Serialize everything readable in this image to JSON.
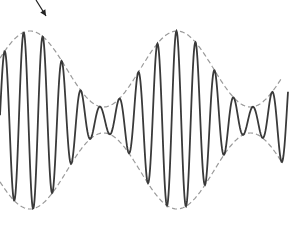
{
  "diagram": {
    "type": "amplitude-modulated-wave",
    "colors": {
      "background": "#ffffff",
      "carrier": "#3a3a3a",
      "envelope": "#9a9a9a",
      "arrow": "#222222"
    },
    "canvas": {
      "width": 295,
      "height": 241
    },
    "signal": {
      "x_start": 0,
      "x_end": 288,
      "center_y": 120,
      "carrier_period_px": 19.1,
      "carrier_phase_px": 1.2,
      "envelope_mean_amp": 51,
      "envelope_mod_amp": 38,
      "envelope_period_px": 147,
      "envelope_peak_x": 30
    },
    "envelope": {
      "x_start": 0,
      "x_end": 282,
      "style": "dashed"
    },
    "arrow": {
      "from": [
        36,
        0
      ],
      "to": [
        46,
        16
      ]
    }
  }
}
